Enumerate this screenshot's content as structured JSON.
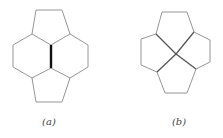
{
  "figures": [
    {
      "id": "a",
      "label": "(a)",
      "description": "Two hexagons and two pentagons sharing a bold central edge",
      "thin_edges": [
        [
          [
            36,
            10
          ],
          [
            62,
            10
          ]
        ],
        [
          [
            62,
            10
          ],
          [
            70,
            34
          ]
        ],
        [
          [
            36,
            10
          ],
          [
            32,
            34
          ]
        ],
        [
          [
            32,
            34
          ],
          [
            51,
            45
          ]
        ],
        [
          [
            70,
            34
          ],
          [
            51,
            45
          ]
        ],
        [
          [
            32,
            34
          ],
          [
            13,
            45
          ]
        ],
        [
          [
            13,
            45
          ],
          [
            13,
            67
          ]
        ],
        [
          [
            13,
            67
          ],
          [
            32,
            78
          ]
        ],
        [
          [
            32,
            78
          ],
          [
            51,
            68
          ]
        ],
        [
          [
            70,
            34
          ],
          [
            88,
            45
          ]
        ],
        [
          [
            88,
            45
          ],
          [
            88,
            67
          ]
        ],
        [
          [
            88,
            67
          ],
          [
            70,
            78
          ]
        ],
        [
          [
            70,
            78
          ],
          [
            51,
            68
          ]
        ],
        [
          [
            32,
            78
          ],
          [
            36,
            102
          ]
        ],
        [
          [
            36,
            102
          ],
          [
            62,
            102
          ]
        ],
        [
          [
            62,
            102
          ],
          [
            70,
            78
          ]
        ]
      ],
      "bold_edges": [
        [
          [
            51,
            45
          ],
          [
            51,
            68
          ]
        ]
      ]
    },
    {
      "id": "b",
      "label": "(b)",
      "description": "Four pentagons meeting at a single central vertex",
      "thin_edges": [
        [
          [
            162,
            12
          ],
          [
            187,
            12
          ]
        ],
        [
          [
            162,
            12
          ],
          [
            156,
            34
          ]
        ],
        [
          [
            187,
            12
          ],
          [
            194,
            32
          ]
        ],
        [
          [
            156,
            34
          ],
          [
            176,
            54
          ]
        ],
        [
          [
            194,
            32
          ],
          [
            176,
            54
          ]
        ],
        [
          [
            156,
            34
          ],
          [
            141,
            39
          ]
        ],
        [
          [
            141,
            39
          ],
          [
            141,
            65
          ]
        ],
        [
          [
            141,
            65
          ],
          [
            157,
            72
          ]
        ],
        [
          [
            157,
            72
          ],
          [
            176,
            54
          ]
        ],
        [
          [
            194,
            32
          ],
          [
            210,
            40
          ]
        ],
        [
          [
            210,
            40
          ],
          [
            210,
            62
          ]
        ],
        [
          [
            210,
            62
          ],
          [
            196,
            69
          ]
        ],
        [
          [
            196,
            69
          ],
          [
            176,
            54
          ]
        ],
        [
          [
            157,
            72
          ],
          [
            165,
            93
          ]
        ],
        [
          [
            165,
            93
          ],
          [
            187,
            93
          ]
        ],
        [
          [
            187,
            93
          ],
          [
            196,
            69
          ]
        ]
      ],
      "bold_edges": []
    }
  ],
  "colors": {
    "thin_line": "#8a8a8a",
    "bold_line": "#111111",
    "background": "#ffffff"
  }
}
